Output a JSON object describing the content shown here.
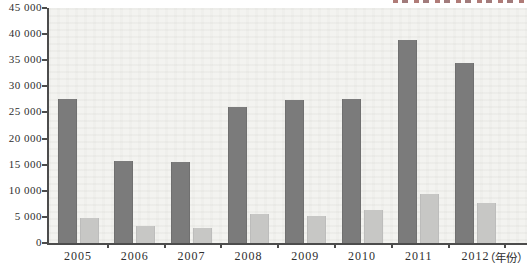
{
  "chart_data": {
    "type": "bar",
    "title": "",
    "categories": [
      "2005",
      "2006",
      "2007",
      "2008",
      "2009",
      "2010",
      "2011",
      "2012"
    ],
    "series": [
      {
        "name": "series-1-dark-gray",
        "color": "#7b7b7b",
        "values": [
          27600,
          15700,
          15500,
          26000,
          27300,
          27500,
          38900,
          34500
        ]
      },
      {
        "name": "series-2-light-gray",
        "color": "#c7c7c5",
        "values": [
          4800,
          3300,
          2900,
          5500,
          5100,
          6300,
          9300,
          7700
        ]
      }
    ],
    "ylim": [
      0,
      45000
    ],
    "ytick_step": 5000,
    "ytick_labels": [
      "0",
      "5 000",
      "10 000",
      "15 000",
      "20 000",
      "25 000",
      "30 000",
      "35 000",
      "40 000",
      "45 000"
    ],
    "xlabel": "",
    "ylabel": "",
    "x_axis_suffix": "（年份）",
    "grid": false,
    "legend_position": "top-right, clipped off the top edge of the image (illegible)"
  },
  "axis_colors": {
    "line": "#4c4c4c",
    "text": "#2e2e2e"
  },
  "plot_background": "#f3f3f0"
}
